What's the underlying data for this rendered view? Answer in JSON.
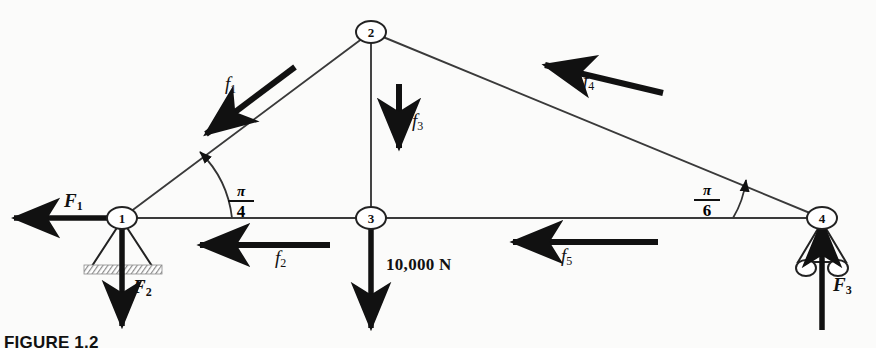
{
  "figure": {
    "caption": "FIGURE 1.2"
  },
  "nodes": [
    {
      "id": "1",
      "label": "1",
      "x": 122,
      "y": 218,
      "support": "pin"
    },
    {
      "id": "2",
      "label": "2",
      "x": 371,
      "y": 32,
      "support": "none"
    },
    {
      "id": "3",
      "label": "3",
      "x": 371,
      "y": 218,
      "support": "none"
    },
    {
      "id": "4",
      "label": "4",
      "x": 822,
      "y": 218,
      "support": "roller"
    }
  ],
  "members": [
    {
      "name": "member-1-2",
      "from": "1",
      "to": "2"
    },
    {
      "name": "member-2-3",
      "from": "2",
      "to": "3"
    },
    {
      "name": "member-2-4",
      "from": "2",
      "to": "4"
    },
    {
      "name": "member-1-3",
      "from": "1",
      "to": "3"
    },
    {
      "name": "member-3-4",
      "from": "3",
      "to": "4"
    }
  ],
  "member_forces": [
    {
      "name": "f1",
      "label": "f",
      "sub": "1",
      "direction": "down-left",
      "on_member": "member-1-2"
    },
    {
      "name": "f2",
      "label": "f",
      "sub": "2",
      "direction": "left",
      "on_member": "member-1-3"
    },
    {
      "name": "f3",
      "label": "f",
      "sub": "3",
      "direction": "down",
      "on_member": "member-2-3"
    },
    {
      "name": "f4",
      "label": "f",
      "sub": "4",
      "direction": "up-left",
      "on_member": "member-2-4"
    },
    {
      "name": "f5",
      "label": "f",
      "sub": "5",
      "direction": "left",
      "on_member": "member-3-4"
    }
  ],
  "reactions": [
    {
      "name": "F1",
      "label": "F",
      "sub": "1",
      "direction": "left",
      "at_node": "1"
    },
    {
      "name": "F2",
      "label": "F",
      "sub": "2",
      "direction": "down",
      "at_node": "1"
    },
    {
      "name": "F3",
      "label": "F",
      "sub": "3",
      "direction": "up",
      "at_node": "4"
    }
  ],
  "applied_load": {
    "name": "applied-load",
    "text": "10,000 N",
    "direction": "down",
    "at_node": "3"
  },
  "angles": [
    {
      "name": "angle-pi-4",
      "numerator": "π",
      "denominator": "4",
      "at_node": "1"
    },
    {
      "name": "angle-pi-6",
      "numerator": "π",
      "denominator": "6",
      "at_node": "4"
    }
  ],
  "colors": {
    "ink": "#111111",
    "member_line": "#3a3a3a",
    "hatch": "#9a9a9a",
    "paper": "#fbfbfa"
  }
}
